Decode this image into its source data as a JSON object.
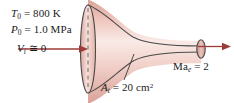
{
  "figure": {
    "name": "converging-diverging-nozzle-diagram",
    "background_color": "#ffffff"
  },
  "colors": {
    "arrow": "#9c3b37",
    "outline": "#4a4a4a",
    "body_light": "#f7e2de",
    "body_mid": "#eec3ba",
    "body_dark": "#d9a398",
    "text": "#1a1a1a",
    "leader_line": "#3a3a3a",
    "centerline": "#6b6b6b"
  },
  "labels": {
    "inlet_temperature": {
      "symbol": "T",
      "subscript": "0",
      "equals": " = ",
      "value": "800 K",
      "full": "T0 = 800 K"
    },
    "inlet_pressure": {
      "symbol": "P",
      "subscript": "0",
      "equals": " = ",
      "value": "1.0 MPa",
      "full": "P0 = 1.0 MPa"
    },
    "inlet_velocity": {
      "symbol": "V",
      "subscript": "i",
      "equals": " ≅ ",
      "value": "0",
      "full": "Vi = 0"
    },
    "throat_area": {
      "symbol": "A",
      "subscript": "t",
      "equals": " = ",
      "value": "20 cm",
      "superscript": "2",
      "full": "At = 20 cm2"
    },
    "exit_mach": {
      "symbol": "Ma",
      "subscript": "e",
      "equals": " = ",
      "value": "2",
      "full": "Mae = 2"
    }
  },
  "icons": {
    "inlet_arrow": "flow-arrow-right",
    "exit_arrow": "flow-arrow-right",
    "centerline": "dashed-vertical-line",
    "leader": "callout-leader-line"
  }
}
